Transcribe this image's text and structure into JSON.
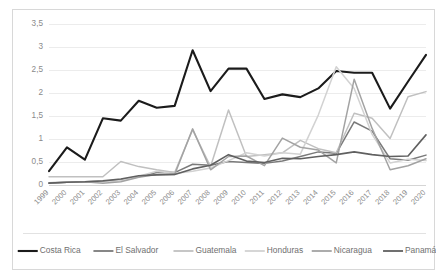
{
  "chart_data": {
    "type": "line",
    "title": "",
    "xlabel": "",
    "ylabel": "",
    "ylim": [
      0,
      3.5
    ],
    "ytick_labels": [
      "0",
      "0,5",
      "1",
      "1,5",
      "2",
      "2,5",
      "3",
      "3,5"
    ],
    "ytick_values": [
      0,
      0.5,
      1,
      1.5,
      2,
      2.5,
      3,
      3.5
    ],
    "grid": true,
    "legend_position": "bottom",
    "decimal_separator": ",",
    "categories": [
      "1999",
      "2000",
      "2001",
      "2002",
      "2003",
      "2004",
      "2005",
      "2006",
      "2007",
      "2008",
      "2009",
      "2010",
      "2011",
      "2012",
      "2013",
      "2014",
      "2015",
      "2016",
      "2017",
      "2018",
      "2019",
      "2020"
    ],
    "series": [
      {
        "name": "Costa Rica",
        "color": "#1b1b1b",
        "width": 2.1,
        "values": [
          0.3,
          0.82,
          0.55,
          1.45,
          1.4,
          1.83,
          1.68,
          1.72,
          2.93,
          2.04,
          2.53,
          2.53,
          1.87,
          1.97,
          1.91,
          2.1,
          2.48,
          2.44,
          2.44,
          1.66,
          2.25,
          2.83
        ]
      },
      {
        "name": "El Salvador",
        "color": "#7a7a7a",
        "width": 1.5,
        "values": [
          0.04,
          0.06,
          0.07,
          0.08,
          0.11,
          0.18,
          0.27,
          0.27,
          0.45,
          0.43,
          0.51,
          0.49,
          0.47,
          0.52,
          0.62,
          0.72,
          0.69,
          1.37,
          1.17,
          0.57,
          0.54,
          0.65
        ]
      },
      {
        "name": "Guatemala",
        "color": "#c0c0c0",
        "width": 1.5,
        "values": [
          0.18,
          0.18,
          0.18,
          0.18,
          0.51,
          0.4,
          0.33,
          0.27,
          1.2,
          0.4,
          1.63,
          0.62,
          0.66,
          0.7,
          0.97,
          0.79,
          0.7,
          1.56,
          1.45,
          1.01,
          1.92,
          2.03
        ]
      },
      {
        "name": "Honduras",
        "color": "#d2d2d2",
        "width": 1.5,
        "values": [
          0.05,
          0.06,
          0.07,
          0.07,
          0.1,
          0.19,
          0.3,
          0.25,
          0.3,
          0.37,
          0.53,
          0.7,
          0.63,
          0.7,
          0.67,
          1.52,
          2.57,
          2.1,
          1.1,
          0.48,
          0.56,
          0.53
        ]
      },
      {
        "name": "Nicaragua",
        "color": "#a3a3a3",
        "width": 1.5,
        "values": [
          0.05,
          0.06,
          0.07,
          0.04,
          0.07,
          0.17,
          0.23,
          0.23,
          1.22,
          0.33,
          0.62,
          0.63,
          0.42,
          1.02,
          0.82,
          0.76,
          0.48,
          2.3,
          1.23,
          0.33,
          0.42,
          0.57
        ]
      },
      {
        "name": "Panamá",
        "color": "#606060",
        "width": 1.6,
        "values": [
          0.04,
          0.06,
          0.07,
          0.09,
          0.13,
          0.2,
          0.22,
          0.23,
          0.35,
          0.43,
          0.66,
          0.52,
          0.49,
          0.58,
          0.57,
          0.62,
          0.66,
          0.72,
          0.66,
          0.62,
          0.63,
          1.09
        ]
      }
    ]
  },
  "legend": {
    "entries": [
      {
        "label": "Costa Rica"
      },
      {
        "label": "El Salvador"
      },
      {
        "label": "Guatemala"
      },
      {
        "label": "Honduras"
      },
      {
        "label": "Nicaragua"
      },
      {
        "label": "Panamá"
      }
    ]
  }
}
